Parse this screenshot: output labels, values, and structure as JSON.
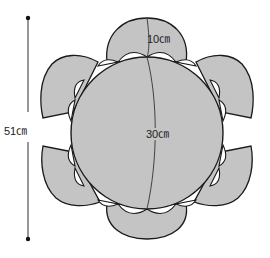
{
  "diagram": {
    "colors": {
      "fill": "#c4c4c4",
      "stroke": "#1a1a1a",
      "scallop": "#ffffff",
      "background": "#ffffff"
    },
    "labels": {
      "overall_height": "51㎝",
      "center_diameter": "30㎝",
      "petal_depth": "10㎝"
    },
    "center_circle": {
      "cx": 147,
      "cy": 133,
      "r": 76
    },
    "petal_count": 6,
    "dimension_line": {
      "x": 28,
      "y1": 18,
      "y2": 239
    }
  }
}
